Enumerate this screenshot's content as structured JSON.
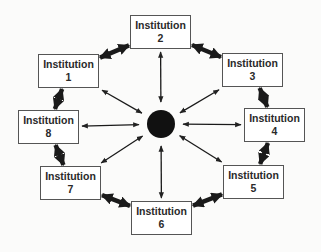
{
  "diagram": {
    "type": "hub-and-ring network",
    "hub": {
      "label": "",
      "color": "#111111"
    },
    "nodes": [
      {
        "id": 1,
        "title": "Institution",
        "number": "1"
      },
      {
        "id": 2,
        "title": "Institution",
        "number": "2"
      },
      {
        "id": 3,
        "title": "Institution",
        "number": "3"
      },
      {
        "id": 4,
        "title": "Institution",
        "number": "4"
      },
      {
        "id": 5,
        "title": "Institution",
        "number": "5"
      },
      {
        "id": 6,
        "title": "Institution",
        "number": "6"
      },
      {
        "id": 7,
        "title": "Institution",
        "number": "7"
      },
      {
        "id": 8,
        "title": "Institution",
        "number": "8"
      }
    ],
    "ring_links": [
      [
        1,
        2
      ],
      [
        2,
        3
      ],
      [
        3,
        4
      ],
      [
        4,
        5
      ],
      [
        5,
        6
      ],
      [
        6,
        7
      ],
      [
        7,
        8
      ],
      [
        8,
        1
      ]
    ],
    "hub_links": [
      1,
      2,
      3,
      4,
      5,
      6,
      7,
      8
    ],
    "ring_link_style": "thick double-headed arrow",
    "hub_link_style": "thin double-headed arrow"
  }
}
